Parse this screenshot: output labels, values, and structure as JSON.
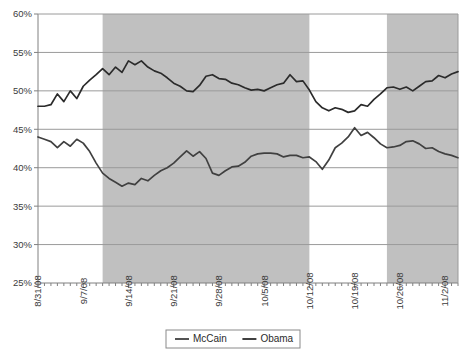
{
  "chart_data": {
    "type": "line",
    "title": "",
    "subtitle": "",
    "xlabel": "",
    "ylabel": "",
    "ylim": [
      25,
      60
    ],
    "ytick_values": [
      25,
      30,
      35,
      40,
      45,
      50,
      55,
      60
    ],
    "ytick_labels": [
      "25%",
      "30%",
      "35%",
      "40%",
      "45%",
      "50%",
      "55%",
      "60%"
    ],
    "grid": true,
    "grid_axis": "y",
    "legend_position": "bottom",
    "x_start": "8/31/08",
    "x_end": "11/4/08",
    "x_tick_interval_days": 1,
    "x_label_interval_days": 7,
    "xtick_labels": [
      "8/31/08",
      "9/7/08",
      "9/14/08",
      "9/21/08",
      "9/28/08",
      "10/5/08",
      "10/12/08",
      "10/19/08",
      "10/26/08",
      "11/2/08"
    ],
    "xtick_label_indices": [
      0,
      7,
      14,
      21,
      28,
      35,
      42,
      49,
      56,
      63
    ],
    "shaded_bands": [
      {
        "start_index": 10,
        "end_index": 42,
        "color": "#c0c0c0"
      },
      {
        "start_index": 54,
        "end_index": 65,
        "color": "#c0c0c0"
      }
    ],
    "series": [
      {
        "name": "McCain",
        "color": "#404040",
        "values": [
          44.0,
          43.7,
          43.4,
          42.6,
          43.4,
          42.8,
          43.7,
          43.2,
          42.1,
          40.6,
          39.3,
          38.6,
          38.1,
          37.6,
          38.0,
          37.8,
          38.6,
          38.3,
          39.0,
          39.6,
          40.0,
          40.6,
          41.4,
          42.2,
          41.5,
          42.1,
          41.2,
          39.3,
          39.0,
          39.6,
          40.1,
          40.2,
          40.7,
          41.5,
          41.8,
          41.9,
          41.9,
          41.8,
          41.4,
          41.6,
          41.6,
          41.3,
          41.4,
          40.8,
          39.8,
          41.0,
          42.6,
          43.2,
          44.0,
          45.2,
          44.2,
          44.6,
          43.9,
          43.1,
          42.6,
          42.7,
          42.9,
          43.4,
          43.5,
          43.1,
          42.5,
          42.6,
          42.1,
          41.8,
          41.6,
          41.3
        ],
        "start_value": 44.0,
        "end_value": 41.3,
        "min_value": 37.6,
        "max_value": 45.2
      },
      {
        "name": "Obama",
        "color": "#2b2b2b",
        "values": [
          48.0,
          48.0,
          48.2,
          49.6,
          48.6,
          50.0,
          49.0,
          50.6,
          51.4,
          52.1,
          52.9,
          52.1,
          53.1,
          52.4,
          53.9,
          53.4,
          53.9,
          53.1,
          52.6,
          52.3,
          51.7,
          51.0,
          50.6,
          50.0,
          49.9,
          50.7,
          51.9,
          52.1,
          51.6,
          51.5,
          51.0,
          50.8,
          50.4,
          50.1,
          50.2,
          50.0,
          50.4,
          50.8,
          51.0,
          52.1,
          51.2,
          51.3,
          50.1,
          48.6,
          47.8,
          47.4,
          47.8,
          47.6,
          47.2,
          47.4,
          48.2,
          48.0,
          48.9,
          49.6,
          50.4,
          50.5,
          50.2,
          50.5,
          50.0,
          50.6,
          51.2,
          51.3,
          52.0,
          51.7,
          52.2,
          52.5
        ],
        "start_value": 48.0,
        "end_value": 52.5,
        "min_value": 47.2,
        "max_value": 53.9
      }
    ]
  },
  "legend": {
    "items": [
      {
        "label": "McCain",
        "color": "#404040"
      },
      {
        "label": "Obama",
        "color": "#2b2b2b"
      }
    ]
  },
  "axes": {
    "plot_left": 38,
    "plot_right": 458,
    "plot_top": 14,
    "plot_bottom": 283,
    "axis_color": "#808080",
    "grid_color": "#9a9a9a",
    "background": "#ffffff"
  }
}
